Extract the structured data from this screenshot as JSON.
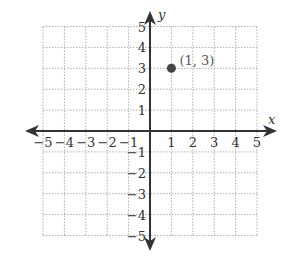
{
  "chart_data": {
    "type": "scatter",
    "title": "",
    "xlabel": "x",
    "ylabel": "y",
    "xlim": [
      -5,
      5
    ],
    "ylim": [
      -5,
      5
    ],
    "grid": true,
    "x_ticks": [
      "−5",
      "−4",
      "−3",
      "−2",
      "−1",
      "1",
      "2",
      "3",
      "4",
      "5"
    ],
    "y_ticks": [
      "5",
      "4",
      "3",
      "2",
      "1",
      "−1",
      "−2",
      "−3",
      "−4",
      "−5"
    ],
    "series": [
      {
        "name": "point",
        "points": [
          {
            "x": 1,
            "y": 3,
            "label": "(1, 3)"
          }
        ]
      }
    ],
    "colors": {
      "axis": "#333333",
      "grid": "#b0b0b0",
      "point": "#444444"
    }
  }
}
